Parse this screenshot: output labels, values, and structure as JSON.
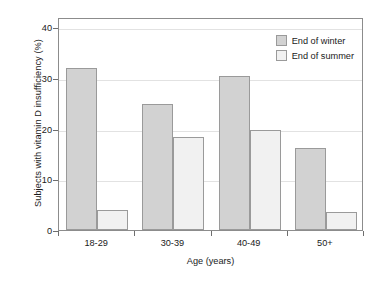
{
  "chart_data": {
    "type": "bar",
    "title": "",
    "xlabel": "Age (years)",
    "ylabel": "Subjects with vitamin D insufficiency (%)",
    "categories": [
      "18-29",
      "30-39",
      "40-49",
      "50+"
    ],
    "yticks": [
      "0",
      "10",
      "20",
      "30",
      "40"
    ],
    "ytick_values": [
      0,
      10,
      20,
      30,
      40
    ],
    "ylim": [
      0,
      42
    ],
    "grid": "horizontal",
    "legend_position": "top-right",
    "series": [
      {
        "name": "End of winter",
        "color": "#d2d2d2",
        "values": [
          32.0,
          24.9,
          30.4,
          16.2
        ]
      },
      {
        "name": "End of summer",
        "color": "#f1f1f1",
        "values": [
          4.0,
          18.4,
          19.8,
          3.6
        ]
      }
    ]
  },
  "axis": {
    "frame_color": "#8c8c8c",
    "grid_color": "#e2e2e2",
    "tick_color": "#6e6e6e"
  }
}
